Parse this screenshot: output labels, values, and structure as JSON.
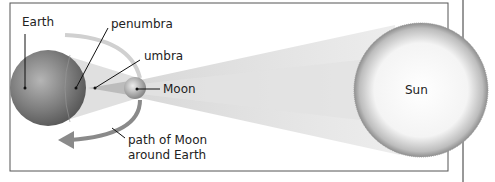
{
  "diagram": {
    "labels": {
      "earth": "Earth",
      "penumbra": "penumbra",
      "umbra": "umbra",
      "moon": "Moon",
      "sun": "Sun",
      "path_line1": "path of Moon",
      "path_line2": "around Earth"
    },
    "bodies": [
      {
        "name": "Earth",
        "cx": 48,
        "cy": 88,
        "r": 38
      },
      {
        "name": "Moon",
        "cx": 135,
        "cy": 88,
        "r": 11
      },
      {
        "name": "Sun",
        "cx": 421,
        "cy": 90,
        "r": 67
      }
    ],
    "colors": {
      "frame": "#555555",
      "earth": "#7a7a7a",
      "path_arrow": "#8a8a8a",
      "sun_edge": "#9a9a9a"
    }
  }
}
